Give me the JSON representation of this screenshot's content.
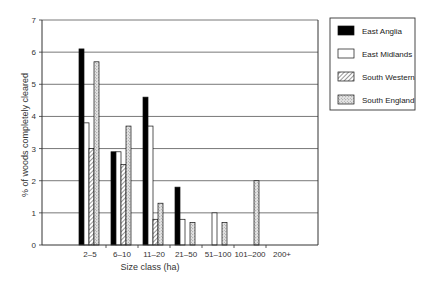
{
  "chart_data": {
    "type": "bar",
    "title": "",
    "xlabel": "Size class (ha)",
    "ylabel": "% of woods completely cleared",
    "ylim": [
      0,
      7
    ],
    "yticks": [
      0,
      1,
      2,
      3,
      4,
      5,
      6,
      7
    ],
    "grid": true,
    "legend_position": "right",
    "categories": [
      "2–5",
      "6–10",
      "11–20",
      "21–50",
      "51–100",
      "101–200",
      "200+"
    ],
    "series": [
      {
        "name": "East Anglia",
        "pattern": "solid-black",
        "values": [
          6.1,
          2.9,
          4.6,
          1.8,
          0,
          0,
          0
        ]
      },
      {
        "name": "East Midlands",
        "pattern": "white",
        "values": [
          3.8,
          2.9,
          3.7,
          0.8,
          1.0,
          0,
          0
        ]
      },
      {
        "name": "South Western",
        "pattern": "diagonal-hatch",
        "values": [
          3.0,
          2.5,
          0.8,
          0,
          0,
          0,
          0
        ]
      },
      {
        "name": "South England",
        "pattern": "stipple",
        "values": [
          5.7,
          3.7,
          1.3,
          0.7,
          0.7,
          2.0,
          0
        ]
      }
    ]
  }
}
